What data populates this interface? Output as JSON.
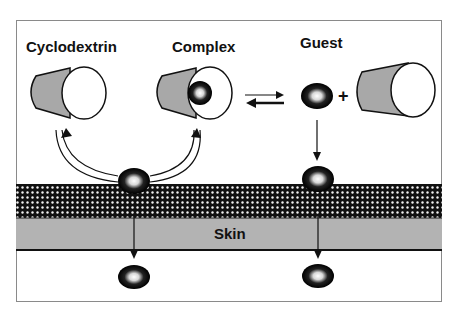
{
  "labels": {
    "cyclodextrin": "Cyclodextrin",
    "complex": "Complex",
    "guest": "Guest",
    "plus": "+",
    "skin": "Skin"
  },
  "colors": {
    "cone_fill": "#a8a8a8",
    "outline": "#111111",
    "skin_band": "#b3b3b3",
    "dotted_band": "#111111",
    "frame": "#8a8a8a"
  },
  "elements": {
    "cones": [
      "cyclodextrin",
      "complex",
      "free-cyclodextrin"
    ],
    "guest_molecules": 5,
    "equilibrium_arrows": "reversible",
    "layers": [
      "stratum-corneum-dotted",
      "skin"
    ]
  }
}
